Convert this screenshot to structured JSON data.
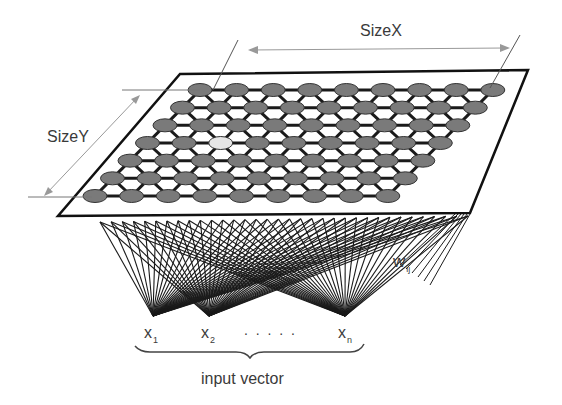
{
  "diagram": {
    "labels": {
      "size_x": "SizeX",
      "size_y": "SizeY",
      "weights": "w",
      "weights_sub": "ij",
      "input_vector": "input vector",
      "dots": ". . . . ."
    },
    "inputs": [
      {
        "name": "x",
        "sub": "1"
      },
      {
        "name": "x",
        "sub": "2"
      },
      {
        "name": "x",
        "sub": "n"
      }
    ],
    "grid": {
      "rows": 7,
      "cols": 9,
      "highlight_node": {
        "row": 3,
        "col": 2
      }
    },
    "colors": {
      "node_fill": "#7a7a7a",
      "node_highlight": "#e6e6e6",
      "line": "#1a1a1a",
      "dimension_line": "#9a9a9a"
    }
  }
}
